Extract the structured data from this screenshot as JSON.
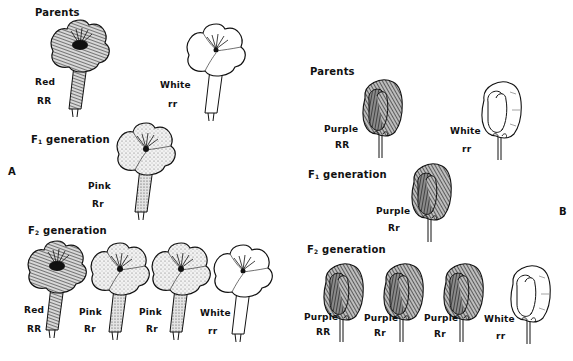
{
  "panels": {
    "A": {
      "letter": "A",
      "plant": "four-o'clock",
      "parents_heading": "Parents",
      "parents": [
        {
          "color": "Red",
          "genotype": "RR",
          "shade": "dark"
        },
        {
          "color": "White",
          "genotype": "rr",
          "shade": "white"
        }
      ],
      "f1_heading_prefix": "F",
      "f1_heading_sub": "1",
      "f1_heading_suffix": " generation",
      "f1": [
        {
          "color": "Pink",
          "genotype": "Rr",
          "shade": "stipple"
        }
      ],
      "f2_heading_prefix": "F",
      "f2_heading_sub": "2",
      "f2_heading_suffix": " generation",
      "f2": [
        {
          "color": "Red",
          "genotype": "RR",
          "shade": "dark"
        },
        {
          "color": "Pink",
          "genotype": "Rr",
          "shade": "stipple"
        },
        {
          "color": "Pink",
          "genotype": "Rr",
          "shade": "stipple"
        },
        {
          "color": "White",
          "genotype": "rr",
          "shade": "white"
        }
      ]
    },
    "B": {
      "letter": "B",
      "plant": "pea",
      "parents_heading": "Parents",
      "parents": [
        {
          "color": "Purple",
          "genotype": "RR",
          "shade": "dark"
        },
        {
          "color": "White",
          "genotype": "rr",
          "shade": "white"
        }
      ],
      "f1_heading_prefix": "F",
      "f1_heading_sub": "1",
      "f1_heading_suffix": " generation",
      "f1": [
        {
          "color": "Purple",
          "genotype": "Rr",
          "shade": "dark"
        }
      ],
      "f2_heading_prefix": "F",
      "f2_heading_sub": "2",
      "f2_heading_suffix": " generation",
      "f2": [
        {
          "color": "Purple",
          "genotype": "RR",
          "shade": "dark"
        },
        {
          "color": "Purple",
          "genotype": "Rr",
          "shade": "dark"
        },
        {
          "color": "Purple",
          "genotype": "Rr",
          "shade": "dark"
        },
        {
          "color": "White",
          "genotype": "rr",
          "shade": "white"
        }
      ]
    }
  }
}
